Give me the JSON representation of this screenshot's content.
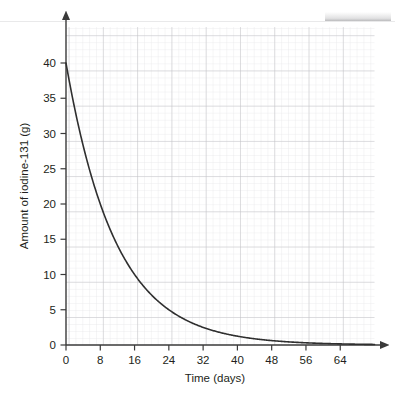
{
  "chart_data": {
    "type": "line",
    "title": "",
    "subtitle": "",
    "xlabel": "Time (days)",
    "ylabel": "Amount of iodine-131 (g)",
    "xlim": [
      0,
      72
    ],
    "ylim": [
      0,
      44
    ],
    "xticks": [
      0,
      8,
      16,
      24,
      32,
      40,
      48,
      56,
      64
    ],
    "xtick_labels": [
      "0",
      "8",
      "16",
      "24",
      "32",
      "40",
      "48",
      "56",
      "64"
    ],
    "yticks": [
      0,
      5,
      10,
      15,
      20,
      25,
      30,
      35,
      40
    ],
    "ytick_labels": [
      "0",
      "5",
      "10",
      "15",
      "20",
      "25",
      "30",
      "35",
      "40"
    ],
    "grid": "major-and-minor",
    "minor_grid_step_x": 2,
    "minor_grid_step_y": 1.25,
    "legend": "none",
    "annotations": [],
    "series": [
      {
        "name": "Iodine-131 decay",
        "color": "#2f2f2f",
        "model": "exponential-decay",
        "initial_amount": 40,
        "half_life_days": 8,
        "x": [
          0,
          2,
          4,
          6,
          8,
          10,
          12,
          14,
          16,
          18,
          20,
          22,
          24,
          26,
          28,
          30,
          32,
          34,
          36,
          38,
          40,
          42,
          44,
          46,
          48,
          50,
          52,
          54,
          56,
          58,
          60,
          62,
          64,
          66,
          68,
          70,
          72
        ],
        "values": [
          40,
          33.64,
          28.28,
          23.78,
          20,
          16.82,
          14.14,
          11.89,
          10,
          8.41,
          7.07,
          5.95,
          5,
          4.21,
          3.54,
          2.97,
          2.5,
          2.1,
          1.77,
          1.49,
          1.25,
          1.05,
          0.88,
          0.74,
          0.63,
          0.53,
          0.44,
          0.37,
          0.31,
          0.26,
          0.22,
          0.19,
          0.16,
          0.13,
          0.11,
          0.09,
          0.08
        ]
      }
    ],
    "key_points": [
      {
        "x": 0,
        "y": 40,
        "note": "initial amount"
      },
      {
        "x": 8,
        "y": 20,
        "note": "one half-life"
      },
      {
        "x": 16,
        "y": 10,
        "note": "two half-lives"
      },
      {
        "x": 24,
        "y": 5,
        "note": "three half-lives"
      },
      {
        "x": 32,
        "y": 2.5,
        "note": "four half-lives"
      }
    ]
  },
  "axes": {
    "x_arrow": true,
    "y_arrow": true,
    "grid_color": "#c8c8cc",
    "minor_grid_color": "#e2e2e6",
    "axis_color": "#3a3a3a",
    "curve_color": "#2f2f2f"
  }
}
